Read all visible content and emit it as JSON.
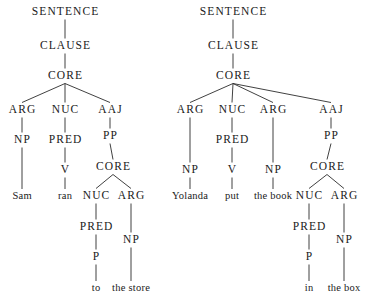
{
  "figure": {
    "kind": "syntactic-tree-pair",
    "background_color": "#ffffff",
    "ink_color": "#1a1a1a",
    "edge_color": "#2b2b2b"
  },
  "trees": [
    {
      "id": "tree-left",
      "sentence": "Sam ran to the store",
      "nodes": [
        {
          "id": "l-sentence",
          "label": "SENTENCE",
          "kind": "category",
          "x": 65,
          "y": 12
        },
        {
          "id": "l-clause",
          "label": "CLAUSE",
          "kind": "category",
          "x": 65,
          "y": 46
        },
        {
          "id": "l-core",
          "label": "CORE",
          "kind": "category",
          "x": 65,
          "y": 76
        },
        {
          "id": "l-arg",
          "label": "ARG",
          "kind": "category",
          "x": 22,
          "y": 110
        },
        {
          "id": "l-nuc",
          "label": "NUC",
          "kind": "category",
          "x": 65,
          "y": 110
        },
        {
          "id": "l-aaj",
          "label": "AAJ",
          "kind": "category",
          "x": 110,
          "y": 110
        },
        {
          "id": "l-np1",
          "label": "NP",
          "kind": "category",
          "x": 22,
          "y": 140
        },
        {
          "id": "l-pred1",
          "label": "PRED",
          "kind": "category",
          "x": 65,
          "y": 140
        },
        {
          "id": "l-pp",
          "label": "PP",
          "kind": "category",
          "x": 110,
          "y": 136
        },
        {
          "id": "l-v",
          "label": "V",
          "kind": "category",
          "x": 65,
          "y": 170
        },
        {
          "id": "l-core2",
          "label": "CORE",
          "kind": "category",
          "x": 113,
          "y": 167
        },
        {
          "id": "l-sam",
          "label": "Sam",
          "kind": "word",
          "x": 22,
          "y": 196
        },
        {
          "id": "l-ran",
          "label": "ran",
          "kind": "word",
          "x": 65,
          "y": 196
        },
        {
          "id": "l-nuc2",
          "label": "NUC",
          "kind": "category",
          "x": 96,
          "y": 196
        },
        {
          "id": "l-arg2",
          "label": "ARG",
          "kind": "category",
          "x": 131,
          "y": 196
        },
        {
          "id": "l-pred2",
          "label": "PRED",
          "kind": "category",
          "x": 96,
          "y": 227
        },
        {
          "id": "l-np2",
          "label": "NP",
          "kind": "category",
          "x": 131,
          "y": 240
        },
        {
          "id": "l-p",
          "label": "P",
          "kind": "category",
          "x": 96,
          "y": 257
        },
        {
          "id": "l-to",
          "label": "to",
          "kind": "word",
          "x": 96,
          "y": 288
        },
        {
          "id": "l-thestore",
          "label": "the store",
          "kind": "word",
          "x": 131,
          "y": 288
        }
      ],
      "edges": [
        [
          "l-sentence",
          "l-clause"
        ],
        [
          "l-clause",
          "l-core"
        ],
        [
          "l-core",
          "l-arg"
        ],
        [
          "l-core",
          "l-nuc"
        ],
        [
          "l-core",
          "l-aaj"
        ],
        [
          "l-arg",
          "l-np1"
        ],
        [
          "l-nuc",
          "l-pred1"
        ],
        [
          "l-aaj",
          "l-pp"
        ],
        [
          "l-np1",
          "l-sam"
        ],
        [
          "l-pred1",
          "l-v"
        ],
        [
          "l-v",
          "l-ran"
        ],
        [
          "l-pp",
          "l-core2"
        ],
        [
          "l-core2",
          "l-nuc2"
        ],
        [
          "l-core2",
          "l-arg2"
        ],
        [
          "l-nuc2",
          "l-pred2"
        ],
        [
          "l-arg2",
          "l-np2"
        ],
        [
          "l-pred2",
          "l-p"
        ],
        [
          "l-p",
          "l-to"
        ],
        [
          "l-np2",
          "l-thestore"
        ]
      ]
    },
    {
      "id": "tree-right",
      "sentence": "Yolanda put the book in the box",
      "nodes": [
        {
          "id": "r-sentence",
          "label": "SENTENCE",
          "kind": "category",
          "x": 233,
          "y": 12
        },
        {
          "id": "r-clause",
          "label": "CLAUSE",
          "kind": "category",
          "x": 233,
          "y": 46
        },
        {
          "id": "r-core",
          "label": "CORE",
          "kind": "category",
          "x": 233,
          "y": 76
        },
        {
          "id": "r-arg1",
          "label": "ARG",
          "kind": "category",
          "x": 190,
          "y": 110
        },
        {
          "id": "r-nuc",
          "label": "NUC",
          "kind": "category",
          "x": 232,
          "y": 110
        },
        {
          "id": "r-arg2",
          "label": "ARG",
          "kind": "category",
          "x": 273,
          "y": 110
        },
        {
          "id": "r-aaj",
          "label": "AAJ",
          "kind": "category",
          "x": 331,
          "y": 110
        },
        {
          "id": "r-pred1",
          "label": "PRED",
          "kind": "category",
          "x": 232,
          "y": 140
        },
        {
          "id": "r-pp",
          "label": "PP",
          "kind": "category",
          "x": 331,
          "y": 136
        },
        {
          "id": "r-np1",
          "label": "NP",
          "kind": "category",
          "x": 190,
          "y": 170
        },
        {
          "id": "r-v",
          "label": "V",
          "kind": "category",
          "x": 232,
          "y": 170
        },
        {
          "id": "r-np2",
          "label": "NP",
          "kind": "category",
          "x": 273,
          "y": 170
        },
        {
          "id": "r-core2",
          "label": "CORE",
          "kind": "category",
          "x": 327,
          "y": 167
        },
        {
          "id": "r-yolanda",
          "label": "Yolanda",
          "kind": "word",
          "x": 190,
          "y": 196
        },
        {
          "id": "r-put",
          "label": "put",
          "kind": "word",
          "x": 232,
          "y": 196
        },
        {
          "id": "r-thebook",
          "label": "the book",
          "kind": "word",
          "x": 273,
          "y": 196
        },
        {
          "id": "r-nuc2",
          "label": "NUC",
          "kind": "category",
          "x": 309,
          "y": 196
        },
        {
          "id": "r-arg3",
          "label": "ARG",
          "kind": "category",
          "x": 344,
          "y": 196
        },
        {
          "id": "r-pred2",
          "label": "PRED",
          "kind": "category",
          "x": 309,
          "y": 227
        },
        {
          "id": "r-np3",
          "label": "NP",
          "kind": "category",
          "x": 344,
          "y": 240
        },
        {
          "id": "r-p",
          "label": "P",
          "kind": "category",
          "x": 309,
          "y": 257
        },
        {
          "id": "r-in",
          "label": "in",
          "kind": "word",
          "x": 309,
          "y": 288
        },
        {
          "id": "r-thebox",
          "label": "the box",
          "kind": "word",
          "x": 344,
          "y": 288
        }
      ],
      "edges": [
        [
          "r-sentence",
          "r-clause"
        ],
        [
          "r-clause",
          "r-core"
        ],
        [
          "r-core",
          "r-arg1"
        ],
        [
          "r-core",
          "r-nuc"
        ],
        [
          "r-core",
          "r-arg2"
        ],
        [
          "r-core",
          "r-aaj"
        ],
        [
          "r-nuc",
          "r-pred1"
        ],
        [
          "r-aaj",
          "r-pp"
        ],
        [
          "r-arg1",
          "r-np1"
        ],
        [
          "r-pred1",
          "r-v"
        ],
        [
          "r-arg2",
          "r-np2"
        ],
        [
          "r-np1",
          "r-yolanda"
        ],
        [
          "r-v",
          "r-put"
        ],
        [
          "r-np2",
          "r-thebook"
        ],
        [
          "r-pp",
          "r-core2"
        ],
        [
          "r-core2",
          "r-nuc2"
        ],
        [
          "r-core2",
          "r-arg3"
        ],
        [
          "r-nuc2",
          "r-pred2"
        ],
        [
          "r-arg3",
          "r-np3"
        ],
        [
          "r-pred2",
          "r-p"
        ],
        [
          "r-p",
          "r-in"
        ],
        [
          "r-np3",
          "r-thebox"
        ]
      ]
    }
  ]
}
